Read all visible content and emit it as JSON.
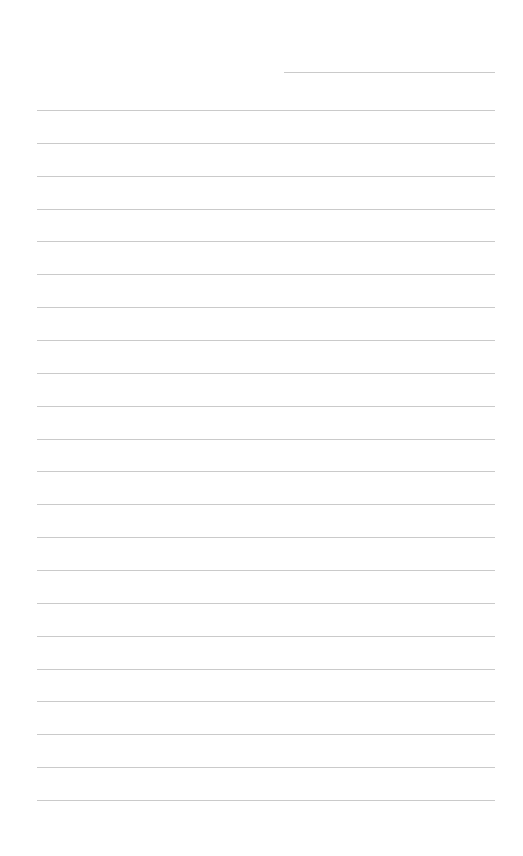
{
  "page": {
    "type": "lined-paper",
    "background_color": "#ffffff",
    "line_color": "#cacaca",
    "header_line": {
      "label": "",
      "left": 284,
      "top": 72,
      "width": 211
    },
    "ruled_lines": {
      "count": 22,
      "left": 37,
      "width": 458,
      "first_top": 110,
      "spacing": 32.86
    }
  }
}
